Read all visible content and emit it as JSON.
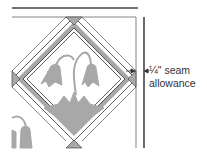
{
  "diagram": {
    "type": "quilt-block-on-point",
    "annotation": {
      "line1": "¼\" seam",
      "line2": "allowance"
    },
    "colors": {
      "fabric": "#a8a8a8",
      "outline": "#333333",
      "border_rule": "#444444",
      "background": "#ffffff"
    }
  }
}
